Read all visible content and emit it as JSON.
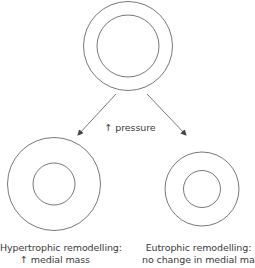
{
  "diagram": {
    "stimulus_label": "↑ pressure",
    "nodes": {
      "top": {
        "name": "normal-vessel",
        "cx": 128,
        "cy": 46,
        "outer_r": 44.5,
        "inner_r": 31
      },
      "left": {
        "name": "hypertrophic-vessel",
        "cx": 54,
        "cy": 184,
        "outer_r": 46.5,
        "inner_r": 21
      },
      "right": {
        "name": "eutrophic-vessel",
        "cx": 202,
        "cy": 189,
        "outer_r": 37,
        "inner_r": 18.5
      }
    },
    "captions": {
      "left": {
        "line1": "Hypertrophic remodelling:",
        "line2": "↑ medial mass"
      },
      "right": {
        "line1": "Eutrophic remodelling:",
        "line2": "no change in medial mass"
      }
    },
    "stroke_color": "#555555"
  }
}
